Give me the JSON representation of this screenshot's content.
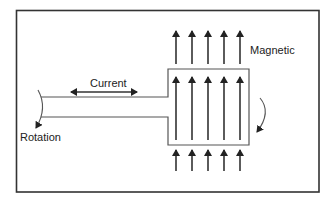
{
  "diagram": {
    "type": "motor-principle",
    "labels": {
      "current": "Current",
      "magnetic": "Magnetic",
      "rotation": "Rotation"
    },
    "colors": {
      "background": "#ffffff",
      "line": "#333333",
      "frame": "#333333",
      "text": "#222222"
    },
    "magnetic_field_arrows": {
      "count_per_row": 5,
      "rows": [
        "top",
        "inside-loop",
        "bottom"
      ],
      "direction": "up"
    },
    "current_arrow": {
      "direction": "bidirectional"
    }
  }
}
